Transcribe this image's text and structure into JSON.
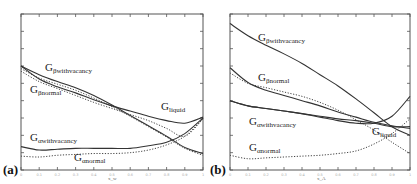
{
  "chart_data": [
    {
      "type": "line",
      "panel": "(a)",
      "title": "",
      "xlabel": "x_w",
      "ylabel": "",
      "xlim": [
        0,
        1
      ],
      "ylim": [
        0,
        9
      ],
      "x_ticks": [
        "0",
        "0.1",
        "0.2",
        "0.3",
        "0.4",
        "0.5",
        "0.6",
        "0.7",
        "0.8",
        "0.9",
        "1"
      ],
      "grid": false,
      "legend": "inline curve labels",
      "x": [
        0,
        0.1,
        0.2,
        0.3,
        0.4,
        0.5,
        0.6,
        0.7,
        0.8,
        0.9,
        1.0
      ],
      "series": [
        {
          "name": "G_βwithvacancy",
          "style": "solid",
          "values": [
            6.0,
            5.5,
            5.1,
            4.75,
            4.3,
            3.75,
            3.15,
            2.55,
            1.95,
            1.3,
            0.95
          ]
        },
        {
          "name": "G_βwithvacancy (dotted)",
          "style": "dotted",
          "values": [
            5.85,
            5.3,
            4.95,
            4.6,
            4.15,
            3.65,
            3.1,
            2.5,
            1.9,
            1.25,
            0.85
          ]
        },
        {
          "name": "G_βnormal",
          "style": "solid",
          "values": [
            6.0,
            5.25,
            4.8,
            4.45,
            4.05,
            3.7,
            3.4,
            3.1,
            2.85,
            2.7,
            3.05
          ]
        },
        {
          "name": "G_liquid",
          "style": "dotted",
          "values": [
            5.7,
            5.1,
            4.7,
            4.3,
            3.9,
            3.55,
            3.2,
            2.85,
            2.4,
            1.95,
            2.95
          ]
        },
        {
          "name": "G_αwithvacancy",
          "style": "solid",
          "values": [
            1.35,
            1.15,
            1.2,
            1.25,
            1.25,
            1.25,
            1.25,
            1.4,
            1.6,
            2.1,
            3.0
          ]
        },
        {
          "name": "G_αnormal",
          "style": "dotted",
          "values": [
            0.8,
            0.75,
            0.85,
            0.9,
            0.95,
            0.95,
            1.0,
            1.15,
            1.45,
            1.95,
            2.95
          ]
        }
      ],
      "annotations": [
        "G_βwithvacancy",
        "G_βnormal",
        "G_liquid",
        "G_αwithvacancy",
        "G_αnormal"
      ]
    },
    {
      "type": "line",
      "panel": "(b)",
      "title": "",
      "xlabel": "x_A",
      "ylabel": "",
      "xlim": [
        0,
        1
      ],
      "ylim": [
        0,
        9
      ],
      "x_ticks": [
        "0",
        "0.1",
        "0.2",
        "0.3",
        "0.4",
        "0.5",
        "0.6",
        "0.7",
        "0.8",
        "0.9",
        "1"
      ],
      "grid": false,
      "legend": "inline curve labels",
      "x": [
        0,
        0.1,
        0.2,
        0.3,
        0.4,
        0.5,
        0.6,
        0.7,
        0.8,
        0.9,
        1.0
      ],
      "series": [
        {
          "name": "G_βwithvacancy",
          "style": "solid",
          "values": [
            8.45,
            7.75,
            7.2,
            6.7,
            6.15,
            5.5,
            4.85,
            4.1,
            3.3,
            2.5,
            2.0
          ]
        },
        {
          "name": "G_βnormal",
          "style": "solid",
          "values": [
            5.9,
            5.05,
            4.6,
            4.3,
            4.0,
            3.7,
            3.35,
            3.05,
            2.75,
            2.55,
            2.4
          ]
        },
        {
          "name": "G_βnormal (dotted)",
          "style": "dotted",
          "values": [
            5.6,
            5.0,
            4.75,
            4.5,
            4.25,
            3.9,
            3.45,
            2.9,
            2.3,
            1.6,
            0.95
          ]
        },
        {
          "name": "G_αwithvacancy",
          "style": "solid",
          "values": [
            4.0,
            3.7,
            3.55,
            3.4,
            3.25,
            3.05,
            2.85,
            2.7,
            2.7,
            3.1,
            4.25
          ]
        },
        {
          "name": "G_liquid",
          "style": "solid",
          "values": [
            4.0,
            3.7,
            3.55,
            3.4,
            3.25,
            3.1,
            2.95,
            2.85,
            2.7,
            2.5,
            2.5
          ]
        },
        {
          "name": "G_αnormal",
          "style": "dotted",
          "values": [
            0.85,
            0.65,
            0.7,
            0.75,
            0.8,
            0.85,
            0.95,
            1.1,
            1.5,
            2.1,
            2.95
          ]
        }
      ],
      "annotations": [
        "G_βwithvacancy",
        "G_βnormal",
        "G_αwithvacancy",
        "G_liquid",
        "G_αnormal"
      ]
    }
  ],
  "figure": {
    "panel_a": {
      "label": "(a)",
      "xlabel": "x_w",
      "labels": {
        "beta_vac": {
          "main": "G",
          "sub": "βwithvacancy"
        },
        "beta_norm": {
          "main": "G",
          "sub": "βnormal"
        },
        "liquid": {
          "main": "G",
          "sub": "liquid"
        },
        "alpha_vac": {
          "main": "G",
          "sub": "αwithvacancy"
        },
        "alpha_norm": {
          "main": "G",
          "sub": "αnormal"
        }
      }
    },
    "panel_b": {
      "label": "(b)",
      "xlabel": "x_A",
      "labels": {
        "beta_vac": {
          "main": "G",
          "sub": "βwithvacancy"
        },
        "beta_norm": {
          "main": "G",
          "sub": "βnormal"
        },
        "liquid": {
          "main": "G",
          "sub": "liquid"
        },
        "alpha_vac": {
          "main": "G",
          "sub": "αwithvacancy"
        },
        "alpha_norm": {
          "main": "G",
          "sub": "αnormal"
        }
      }
    }
  }
}
